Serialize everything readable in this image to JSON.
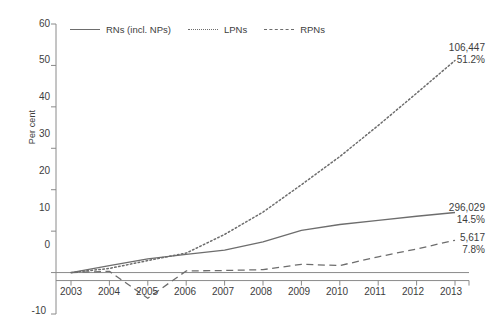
{
  "chart_data": {
    "type": "line",
    "title": "",
    "xlabel": "",
    "ylabel": "Per cent",
    "categories": [
      "2003",
      "2004",
      "2005",
      "2006",
      "2007",
      "2008",
      "2009",
      "2010",
      "2011",
      "2012",
      "2013"
    ],
    "x": [
      2003,
      2004,
      2005,
      2006,
      2007,
      2008,
      2009,
      2010,
      2011,
      2012,
      2013
    ],
    "ylim": [
      -10,
      60
    ],
    "yticks": [
      -10,
      0,
      10,
      20,
      30,
      40,
      50,
      60
    ],
    "grid": false,
    "legend_position": "top-left",
    "series": [
      {
        "name": "RNs (incl. NPs)",
        "style": "solid",
        "values": [
          0,
          1.7,
          3.3,
          4.4,
          5.4,
          7.4,
          10.2,
          11.6,
          12.6,
          13.6,
          14.5
        ],
        "end_value_label": "296,029",
        "end_percent_label": "14.5%"
      },
      {
        "name": "LPNs",
        "style": "dotted",
        "values": [
          0,
          1.0,
          2.9,
          4.7,
          9.2,
          14.6,
          21.2,
          28.0,
          35.5,
          43.3,
          51.2
        ],
        "end_value_label": "106,447",
        "end_percent_label": "51.2%"
      },
      {
        "name": "RPNs",
        "style": "dashed",
        "values": [
          0,
          0.3,
          -6.2,
          0.4,
          0.5,
          0.7,
          2.0,
          1.7,
          3.8,
          5.7,
          7.8
        ],
        "end_value_label": "5,617",
        "end_percent_label": "7.8%"
      }
    ]
  },
  "axis": {
    "y_label": "Per cent",
    "y_ticks": [
      "60",
      "50",
      "40",
      "30",
      "20",
      "10",
      "0",
      "-10"
    ],
    "x_ticks": [
      "2003",
      "2004",
      "2005",
      "2006",
      "2007",
      "2008",
      "2009",
      "2010",
      "2011",
      "2012",
      "2013"
    ]
  },
  "legend": {
    "items": [
      {
        "label": "RNs (incl. NPs)",
        "style": "solid"
      },
      {
        "label": "LPNs",
        "style": "dotted"
      },
      {
        "label": "RPNs",
        "style": "dashed"
      }
    ]
  },
  "annotations": {
    "lpn": {
      "value": "106,447",
      "percent": "51.2%"
    },
    "rn": {
      "value": "296,029",
      "percent": "14.5%"
    },
    "rpn": {
      "value": "5,617",
      "percent": "7.8%"
    }
  },
  "colors": {
    "line": "#6d6d6d",
    "axis": "#8a8a8a",
    "text": "#3d3d3d",
    "background": "#ffffff"
  }
}
